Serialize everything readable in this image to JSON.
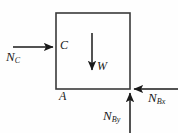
{
  "figure": {
    "type": "free-body-diagram",
    "background_color": "#fefefe",
    "line_color": "#3a3a3a",
    "arrow_color": "#1a1a1a",
    "text_color": "#1a1a1a",
    "body": {
      "shape": "rectangle",
      "x": 56,
      "y": 13,
      "width": 74,
      "height": 76,
      "stroke_width": 1.6
    },
    "points": [
      {
        "name": "C",
        "label": "C",
        "x": 60,
        "y": 47
      },
      {
        "name": "A",
        "label": "A",
        "x": 59,
        "y": 90
      }
    ],
    "forces": [
      {
        "name": "N_C",
        "label_main": "N",
        "label_sub": "C",
        "direction": "right",
        "x1": 13,
        "y1": 47,
        "x2": 55,
        "y2": 47
      },
      {
        "name": "W",
        "label_main": "W",
        "label_sub": "",
        "direction": "down",
        "x1": 92,
        "y1": 33,
        "x2": 92,
        "y2": 73
      },
      {
        "name": "N_Bx",
        "label_main": "N",
        "label_sub": "Bx",
        "direction": "left",
        "x1": 178,
        "y1": 89,
        "x2": 132,
        "y2": 89
      },
      {
        "name": "N_By",
        "label_main": "N",
        "label_sub": "By",
        "direction": "up",
        "x1": 130,
        "y1": 133,
        "x2": 130,
        "y2": 91
      }
    ]
  }
}
